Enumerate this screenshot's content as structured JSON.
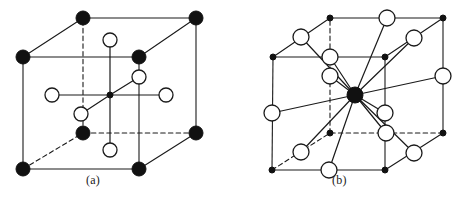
{
  "figure": {
    "background_color": "#ffffff",
    "line_color": "#1a1a1a",
    "filled_atom_color": "#111111",
    "open_atom_fill": "#ffffff",
    "width": 466,
    "height": 202
  },
  "panels": [
    {
      "id": "a",
      "label": "(a)",
      "description": "Cubic unit cell with filled corner atoms, open circles at face centres and a small filled atom at the body centre",
      "cube": {
        "front_top_left": [
          23,
          57
        ],
        "front_top_right": [
          139,
          57
        ],
        "front_bottom_left": [
          23,
          169
        ],
        "front_bottom_right": [
          139,
          169
        ],
        "back_top_left": [
          83,
          18
        ],
        "back_top_right": [
          196,
          18
        ],
        "back_bottom_left": [
          83,
          133
        ],
        "back_bottom_right": [
          196,
          133
        ]
      },
      "dashed_edges": [
        "back_top_left-back_bottom_left",
        "back_bottom_left-back_bottom_right",
        "back_bottom_left-front_bottom_left"
      ],
      "filled_atoms": [
        {
          "name": "corner-front-top-left",
          "x": 23,
          "y": 57,
          "r": 7
        },
        {
          "name": "corner-front-top-right",
          "x": 139,
          "y": 57,
          "r": 7
        },
        {
          "name": "corner-front-bottom-left",
          "x": 23,
          "y": 169,
          "r": 7
        },
        {
          "name": "corner-front-bottom-right",
          "x": 139,
          "y": 169,
          "r": 7
        },
        {
          "name": "corner-back-top-left",
          "x": 83,
          "y": 18,
          "r": 7
        },
        {
          "name": "corner-back-top-right",
          "x": 196,
          "y": 18,
          "r": 7
        },
        {
          "name": "corner-back-bottom-left",
          "x": 83,
          "y": 133,
          "r": 7
        },
        {
          "name": "corner-back-bottom-right",
          "x": 196,
          "y": 133,
          "r": 7
        },
        {
          "name": "body-centre-atom",
          "x": 110,
          "y": 95,
          "r": 3
        }
      ],
      "open_atoms": [
        {
          "name": "face-centre-top",
          "x": 110,
          "y": 40,
          "r": 7
        },
        {
          "name": "face-centre-bottom",
          "x": 110,
          "y": 150,
          "r": 7
        },
        {
          "name": "face-centre-left",
          "x": 52,
          "y": 95,
          "r": 7
        },
        {
          "name": "face-centre-right",
          "x": 166,
          "y": 95,
          "r": 7
        },
        {
          "name": "face-centre-back",
          "x": 139,
          "y": 77,
          "r": 7
        },
        {
          "name": "face-centre-front",
          "x": 81,
          "y": 114,
          "r": 7
        }
      ],
      "bonds": [
        {
          "from": [
            110,
            95
          ],
          "to": [
            110,
            40
          ]
        },
        {
          "from": [
            110,
            95
          ],
          "to": [
            110,
            150
          ]
        },
        {
          "from": [
            110,
            95
          ],
          "to": [
            52,
            95
          ]
        },
        {
          "from": [
            110,
            95
          ],
          "to": [
            166,
            95
          ]
        },
        {
          "from": [
            110,
            95
          ],
          "to": [
            139,
            77
          ]
        },
        {
          "from": [
            110,
            95
          ],
          "to": [
            81,
            114
          ]
        }
      ]
    },
    {
      "id": "b",
      "label": "(b)",
      "description": "Cubic unit cell with small filled corner atoms, twelve open circles at edge midpoints bonded to a large filled central atom",
      "cube": {
        "front_top_left": [
          40,
          57
        ],
        "front_top_right": [
          152,
          57
        ],
        "front_bottom_left": [
          39,
          170
        ],
        "front_bottom_right": [
          152,
          170
        ],
        "back_top_left": [
          97,
          18
        ],
        "back_top_right": [
          210,
          18
        ],
        "back_bottom_left": [
          97,
          133
        ],
        "back_bottom_right": [
          210,
          133
        ]
      },
      "dashed_edges": [
        "back_top_left-back_bottom_left",
        "back_bottom_left-back_bottom_right",
        "back_bottom_left-front_bottom_left"
      ],
      "filled_atoms": [
        {
          "name": "corner-front-top-left",
          "x": 40,
          "y": 57,
          "r": 3
        },
        {
          "name": "corner-front-top-right",
          "x": 152,
          "y": 57,
          "r": 3
        },
        {
          "name": "corner-front-bottom-left",
          "x": 39,
          "y": 170,
          "r": 3
        },
        {
          "name": "corner-front-bottom-right",
          "x": 152,
          "y": 170,
          "r": 3
        },
        {
          "name": "corner-back-top-left",
          "x": 97,
          "y": 18,
          "r": 3
        },
        {
          "name": "corner-back-top-right",
          "x": 210,
          "y": 18,
          "r": 3
        },
        {
          "name": "corner-back-bottom-left",
          "x": 97,
          "y": 133,
          "r": 3
        },
        {
          "name": "corner-back-bottom-right",
          "x": 210,
          "y": 133,
          "r": 3
        },
        {
          "name": "central-atom",
          "x": 122,
          "y": 95,
          "r": 8
        }
      ],
      "open_atoms": [
        {
          "name": "edge-mid-back-top",
          "x": 154,
          "y": 18,
          "r": 8
        },
        {
          "name": "edge-mid-top-left-diagonal",
          "x": 68,
          "y": 37,
          "r": 8
        },
        {
          "name": "edge-mid-top-right-diagonal",
          "x": 181,
          "y": 38,
          "r": 8
        },
        {
          "name": "edge-mid-top-front-back-left",
          "x": 97,
          "y": 57,
          "r": 8
        },
        {
          "name": "edge-mid-left-vertical-upper",
          "x": 97,
          "y": 76,
          "r": 8
        },
        {
          "name": "edge-mid-right-vertical-upper",
          "x": 210,
          "y": 76,
          "r": 8
        },
        {
          "name": "edge-mid-left-front-vertical",
          "x": 39,
          "y": 113,
          "r": 8
        },
        {
          "name": "edge-mid-right-front-vertical",
          "x": 152,
          "y": 113,
          "r": 8
        },
        {
          "name": "edge-mid-back-bottom-centre",
          "x": 153,
          "y": 133,
          "r": 8
        },
        {
          "name": "edge-mid-bottom-left-diagonal",
          "x": 68,
          "y": 152,
          "r": 8
        },
        {
          "name": "edge-mid-bottom-right-diagonal",
          "x": 181,
          "y": 153,
          "r": 8
        },
        {
          "name": "edge-mid-bottom-front",
          "x": 96,
          "y": 170,
          "r": 8
        }
      ],
      "bonds": [
        {
          "from": [
            122,
            95
          ],
          "to": [
            154,
            18
          ]
        },
        {
          "from": [
            122,
            95
          ],
          "to": [
            68,
            37
          ]
        },
        {
          "from": [
            122,
            95
          ],
          "to": [
            181,
            38
          ]
        },
        {
          "from": [
            122,
            95
          ],
          "to": [
            97,
            57
          ]
        },
        {
          "from": [
            122,
            95
          ],
          "to": [
            97,
            76
          ]
        },
        {
          "from": [
            122,
            95
          ],
          "to": [
            210,
            76
          ]
        },
        {
          "from": [
            122,
            95
          ],
          "to": [
            39,
            113
          ]
        },
        {
          "from": [
            122,
            95
          ],
          "to": [
            152,
            113
          ]
        },
        {
          "from": [
            122,
            95
          ],
          "to": [
            153,
            133
          ]
        },
        {
          "from": [
            122,
            95
          ],
          "to": [
            68,
            152
          ]
        },
        {
          "from": [
            122,
            95
          ],
          "to": [
            181,
            153
          ]
        },
        {
          "from": [
            122,
            95
          ],
          "to": [
            96,
            170
          ]
        }
      ]
    }
  ]
}
